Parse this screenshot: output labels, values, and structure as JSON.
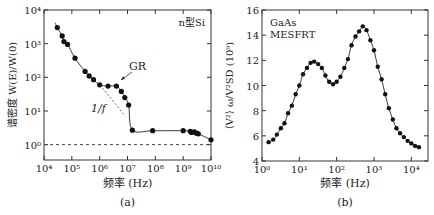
{
  "chart_data": [
    {
      "type": "scatter",
      "panel_label": "(a)",
      "title": "",
      "annotation_material": "n型Si",
      "annotations": [
        "GR",
        "1/f"
      ],
      "xlabel": "频率 (Hz)",
      "ylabel": "谱密度 W(E)/W(0)",
      "xscale": "log",
      "yscale": "log",
      "xlim": [
        10000,
        10000000000
      ],
      "ylim": [
        0.35,
        10000
      ],
      "xticks": [
        "10⁴",
        "10⁵",
        "10⁶",
        "10⁷",
        "10⁸",
        "10⁹",
        "10¹⁰"
      ],
      "yticks": [
        "10⁰",
        "10¹",
        "10²",
        "10³",
        "10⁴"
      ],
      "reference_line": {
        "y": 1,
        "style": "dashed"
      },
      "series": [
        {
          "name": "measured",
          "x": [
            30000,
            45000,
            52000,
            70000,
            130000,
            300000,
            420000,
            600000,
            1000000,
            2000000,
            4000000,
            6000000,
            8000000,
            11000000,
            15000000,
            80000000,
            1000000000,
            1800000000,
            2000000000,
            2500000000,
            3000000000,
            3500000000,
            10000000000
          ],
          "y": [
            3000,
            1700,
            1150,
            950,
            370,
            150,
            110,
            85,
            60,
            55,
            55,
            38,
            25,
            15,
            2.7,
            2.6,
            2.6,
            2.5,
            2.3,
            2.4,
            2.2,
            2.1,
            1.4
          ]
        }
      ]
    },
    {
      "type": "line",
      "panel_label": "(b)",
      "annotation_device": [
        "GaAs",
        "MESFRT"
      ],
      "xlabel": "频率 (Hz)",
      "ylabel": "⟨V²⟩ ω/V²SD (10⁹)",
      "xscale": "log",
      "xlim": [
        1,
        28000
      ],
      "ylim": [
        4,
        16
      ],
      "xticks": [
        "10⁰",
        "10¹",
        "10²",
        "10³",
        "10⁴"
      ],
      "yticks": [
        "4",
        "6",
        "8",
        "10",
        "12",
        "14",
        "16"
      ],
      "series": [
        {
          "name": "measured",
          "x": [
            1.5,
            2,
            2.5,
            3.2,
            4,
            5,
            6.3,
            8,
            10,
            12.6,
            16,
            20,
            25,
            32,
            40,
            50,
            63,
            80,
            100,
            126,
            160,
            200,
            250,
            320,
            400,
            500,
            630,
            800,
            1000,
            1260,
            1600,
            2000,
            2500,
            3200,
            4000,
            5000,
            6300,
            8000,
            10000,
            12600,
            16000
          ],
          "y": [
            5.5,
            5.7,
            6.1,
            6.6,
            7.0,
            7.8,
            8.4,
            9.3,
            10.0,
            10.9,
            11.4,
            11.8,
            11.9,
            11.7,
            11.4,
            10.8,
            10.3,
            10.1,
            10.3,
            10.7,
            11.4,
            12.1,
            13.2,
            13.9,
            14.3,
            14.7,
            14.4,
            13.6,
            12.8,
            11.5,
            10.5,
            9.3,
            8.2,
            7.3,
            6.6,
            6.2,
            5.9,
            5.6,
            5.4,
            5.2,
            5.1
          ]
        }
      ]
    }
  ]
}
